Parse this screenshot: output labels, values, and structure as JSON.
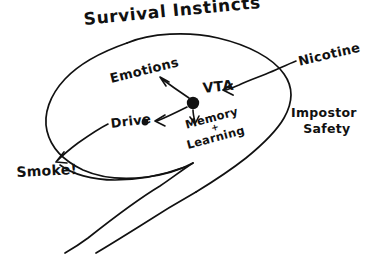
{
  "diagram": {
    "title": "Survival Instincts",
    "background_color": "#ffffff",
    "ink_color": "#111111",
    "style": "hand-drawn sketch",
    "nodes": {
      "hub": "",
      "emotions": "Emotions",
      "vta": "VTA",
      "drive": "Drive",
      "memory_learning": {
        "line1": "Memory",
        "plus": "+",
        "line2": "Learning"
      },
      "outcome": "Smoke!"
    },
    "external_labels": {
      "nicotine": "Nicotine",
      "impostor_safety": {
        "line1": "Impostor",
        "line2": "Safety"
      }
    },
    "edges": [
      {
        "from": "hub",
        "to": "emotions",
        "arrow": "to"
      },
      {
        "from": "hub",
        "to": "drive",
        "arrow": "to"
      },
      {
        "from": "hub",
        "to": "memory_learning",
        "arrow": "to"
      },
      {
        "from": "nicotine",
        "to": "vta",
        "arrow": "to"
      },
      {
        "from": "drive",
        "to": "outcome",
        "arrow": "to"
      }
    ]
  }
}
